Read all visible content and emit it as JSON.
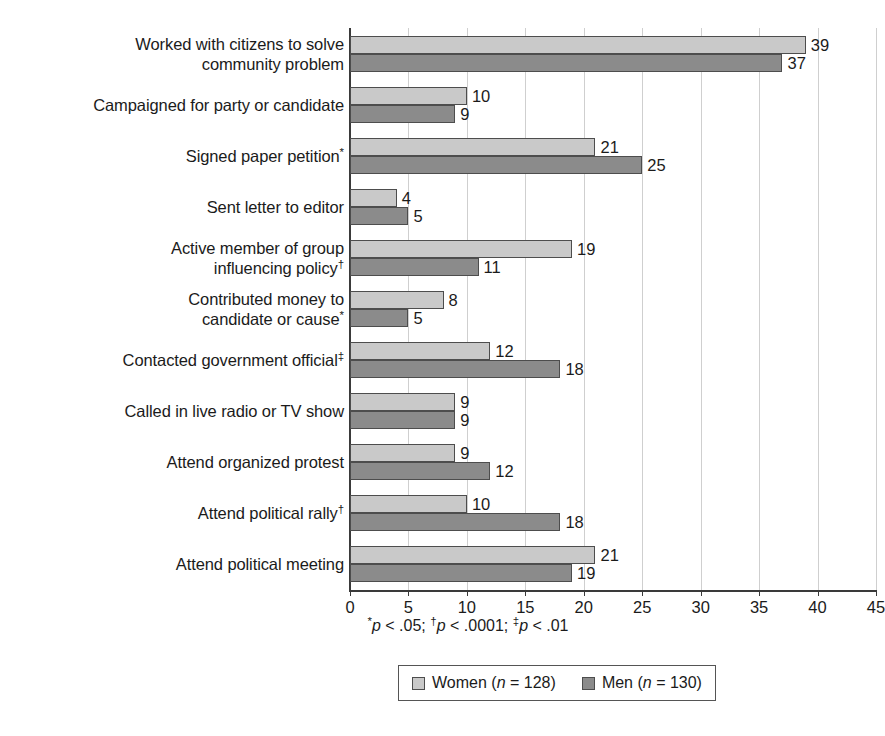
{
  "chart_data": {
    "type": "bar",
    "orientation": "horizontal",
    "title": "",
    "subtitle": "",
    "xlabel": "",
    "ylabel": "",
    "xlim": [
      0,
      45
    ],
    "xticks": [
      0,
      5,
      10,
      15,
      20,
      25,
      30,
      35,
      40,
      45
    ],
    "xtick_labels": [
      "0",
      "5",
      "10",
      "15",
      "20",
      "25",
      "30",
      "35",
      "40",
      "45"
    ],
    "grid": true,
    "grid_axis": "x",
    "legend_position": "bottom",
    "categories": [
      "Worked with citizens to solve\ncommunity problem",
      "Campaigned for party or candidate",
      "Signed paper petition*",
      "Sent letter to editor",
      "Active member of group\ninfluencing policy†",
      "Contributed money to\ncandidate or cause*",
      "Contacted government official‡",
      "Called in live radio or TV show",
      "Attend organized protest",
      "Attend political rally†",
      "Attend political meeting"
    ],
    "category_marks": [
      "",
      "",
      "*",
      "",
      "†",
      "*",
      "‡",
      "",
      "",
      "†",
      ""
    ],
    "series": [
      {
        "name": "Women (n = 128)",
        "color": "#c9c9c9",
        "values": [
          39,
          10,
          21,
          4,
          19,
          8,
          12,
          9,
          9,
          10,
          21
        ]
      },
      {
        "name": "Men (n = 130)",
        "color": "#8b8b8b",
        "values": [
          37,
          9,
          25,
          5,
          11,
          5,
          18,
          9,
          12,
          18,
          19
        ]
      }
    ],
    "annotations": {
      "footnote": "*p < .05; †p < .0001; ‡p < .01"
    }
  },
  "axis": {
    "ticks": [
      "0",
      "5",
      "10",
      "15",
      "20",
      "25",
      "30",
      "35",
      "40",
      "45"
    ]
  },
  "footnote": {
    "mark1": "*",
    "p1": "p",
    "text1": " < .05; ",
    "mark2": "†",
    "p2": "p",
    "text2": " < .0001; ",
    "mark3": "‡",
    "p3": "p",
    "text3": " < .01"
  },
  "legend": {
    "items": [
      {
        "label_prefix": "Women (",
        "n_italic": "n",
        "label_suffix": " = 128)",
        "swatch": "women"
      },
      {
        "label_prefix": "Men (",
        "n_italic": "n",
        "label_suffix": " = 130)",
        "swatch": "men"
      }
    ]
  },
  "colors": {
    "women_bar": "#c9c9c9",
    "men_bar": "#8b8b8b",
    "bar_outline": "#4d4d4d",
    "gridline": "#cfcfcf",
    "axis": "#3a3a3a",
    "text": "#1b1b1b",
    "background": "#ffffff"
  }
}
